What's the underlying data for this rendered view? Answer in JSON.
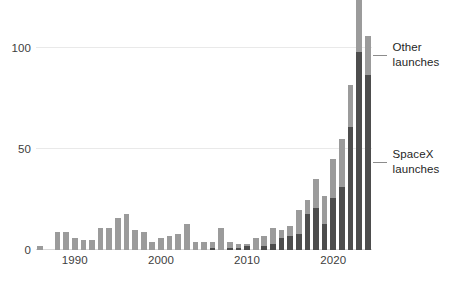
{
  "chart_data": {
    "type": "bar",
    "title": "",
    "subtitle": "",
    "xlabel": "",
    "ylabel": "",
    "stacked": true,
    "grid": true,
    "legend_position": "right-inline-annotations",
    "xlim": [
      1986,
      2024
    ],
    "ylim": [
      0,
      120
    ],
    "yticks": [
      0,
      50,
      100
    ],
    "ytick_labels": [
      "0",
      "50",
      "100"
    ],
    "xticks": [
      1990,
      2000,
      2010,
      2020
    ],
    "xtick_labels": [
      "1990",
      "2000",
      "2010",
      "2020"
    ],
    "colors": {
      "spacex": "#4d4d4d",
      "other": "#9b9b9b",
      "grid": "#e9e9e9",
      "text": "#1f1f1f",
      "tick_text": "#3d3d3d",
      "leader": "#8c8c8c",
      "background": "#ffffff"
    },
    "categories": [
      1986,
      1987,
      1988,
      1989,
      1990,
      1991,
      1992,
      1993,
      1994,
      1995,
      1996,
      1997,
      1998,
      1999,
      2000,
      2001,
      2002,
      2003,
      2004,
      2005,
      2006,
      2007,
      2008,
      2009,
      2010,
      2011,
      2012,
      2013,
      2014,
      2015,
      2016,
      2017,
      2018,
      2019,
      2020,
      2021,
      2022,
      2023,
      2024
    ],
    "series": [
      {
        "name": "SpaceX launches",
        "key": "spacex",
        "color": "#4d4d4d",
        "values": [
          0,
          0,
          0,
          0,
          0,
          0,
          0,
          0,
          0,
          0,
          0,
          0,
          0,
          0,
          0,
          0,
          0,
          0,
          0,
          0,
          1,
          0,
          1,
          1,
          2,
          0,
          2,
          3,
          6,
          7,
          8,
          18,
          21,
          13,
          26,
          31,
          61,
          98,
          87
        ]
      },
      {
        "name": "Other launches",
        "key": "other",
        "color": "#9b9b9b",
        "values": [
          2,
          0,
          9,
          9,
          6,
          5,
          5,
          11,
          11,
          16,
          18,
          10,
          9,
          4,
          6,
          7,
          8,
          13,
          4,
          4,
          3,
          11,
          3,
          2,
          1,
          6,
          5,
          8,
          4,
          5,
          12,
          7,
          14,
          14,
          19,
          24,
          21,
          27,
          19
        ]
      }
    ],
    "totals": [
      2,
      0,
      9,
      9,
      6,
      5,
      5,
      11,
      11,
      16,
      18,
      10,
      9,
      4,
      6,
      7,
      8,
      13,
      4,
      4,
      4,
      11,
      4,
      3,
      3,
      6,
      7,
      11,
      10,
      12,
      20,
      25,
      35,
      27,
      45,
      55,
      82,
      125,
      106
    ]
  },
  "annotations": {
    "other": {
      "label": "Other\nlaunches",
      "line1": "Other",
      "line2": "launches"
    },
    "spacex": {
      "label": "SpaceX\nlaunches",
      "line1": "SpaceX",
      "line2": "launches"
    }
  }
}
